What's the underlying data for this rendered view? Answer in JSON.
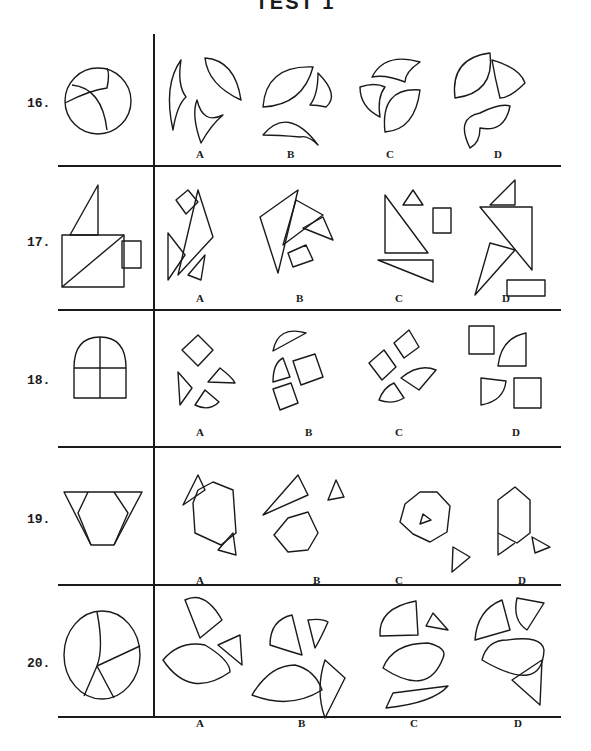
{
  "page": {
    "title": "TEST 1"
  },
  "questions": [
    {
      "number": "16.",
      "options": [
        "A",
        "B",
        "C",
        "D"
      ]
    },
    {
      "number": "17.",
      "options": [
        "A",
        "B",
        "C",
        "D"
      ]
    },
    {
      "number": "18.",
      "options": [
        "A",
        "B",
        "C",
        "D"
      ]
    },
    {
      "number": "19.",
      "options": [
        "A",
        "B",
        "C",
        "D"
      ]
    },
    {
      "number": "20.",
      "options": [
        "A",
        "B",
        "C",
        "D"
      ]
    }
  ],
  "colors": {
    "ink": "#1a1a1a",
    "paper": "#ffffff"
  }
}
